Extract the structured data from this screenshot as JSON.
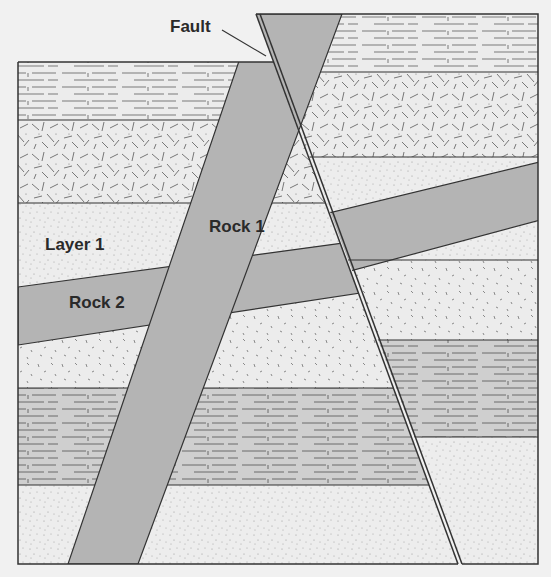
{
  "diagram": {
    "type": "geologic-cross-section",
    "labels": {
      "fault": "Fault",
      "rock1": "Rock 1",
      "rock2": "Rock 2",
      "layer1": "Layer 1"
    },
    "colors": {
      "background": "#f1f1f1",
      "intrusion": "#b4b4b4",
      "gray_limestone": "#cfcfcf",
      "light_layer": "#ececec",
      "outline": "#333333",
      "texture": "#7a7a7a"
    },
    "left_block_layers_top_to_bottom": [
      "limestone (horizontal dashes)",
      "igneous (random dashes)",
      "sandstone — Layer 1",
      "Rock 2 (tilted intrusion band)",
      "speckled sediment",
      "gray limestone",
      "sandstone"
    ],
    "right_block_layers_top_to_bottom": [
      "limestone (horizontal dashes)",
      "igneous (random dashes)",
      "sandstone",
      "Rock 2 (tilted intrusion band)",
      "speckled sediment",
      "gray limestone",
      "sandstone"
    ],
    "features": [
      "Rock 1 dike cuts all layers",
      "Fault offsets right block upward"
    ]
  }
}
